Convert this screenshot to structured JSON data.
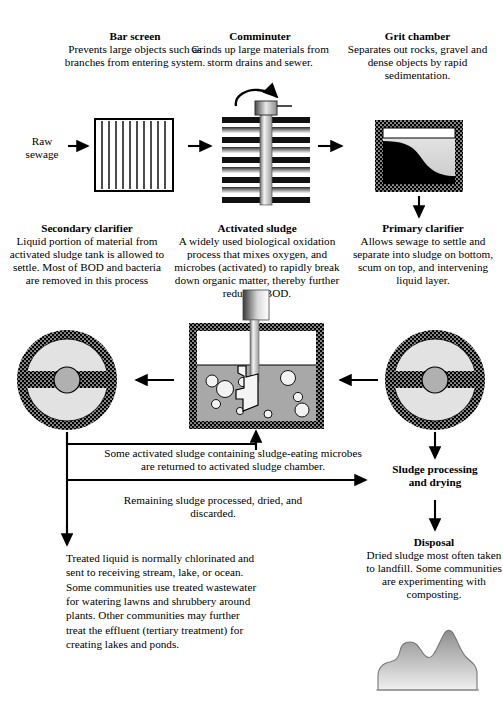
{
  "diagram": {
    "inlet_label": "Raw\nsewage",
    "inlet_label_line1": "Raw",
    "inlet_label_line2": "sewage"
  },
  "stages": {
    "bar_screen": {
      "heading": "Bar screen",
      "body": "Prevents large objects such as branches from entering system."
    },
    "comminuter": {
      "heading": "Comminuter",
      "body": "Grinds up large materials from storm drains and sewer."
    },
    "grit_chamber": {
      "heading": "Grit chamber",
      "body": "Separates out rocks, gravel and dense objects by rapid sedimentation."
    },
    "secondary_clarifier": {
      "heading": "Secondary clarifier",
      "body": "Liquid portion of material from activated sludge tank is allowed to settle. Most of BOD and bacteria are removed in this process"
    },
    "activated_sludge": {
      "heading": "Activated sludge",
      "body": "A widely used biological oxidation process that mixes oxygen, and microbes (activated) to rapidly break down organic matter, thereby further reducing BOD."
    },
    "primary_clarifier": {
      "heading": "Primary clarifier",
      "body": "Allows sewage to settle and separate into sludge on bottom, scum on top, and intervening liquid layer."
    },
    "sludge_processing": {
      "heading": "Sludge processing\nand drying",
      "heading_line1": "Sludge processing",
      "heading_line2": "and drying"
    },
    "disposal": {
      "heading": "Disposal",
      "body": "Dried sludge most often taken to landfill. Some communities are experimenting with composting."
    }
  },
  "notes": {
    "return_sludge": "Some activated sludge containing sludge-eating microbes are returned to activated sludge chamber.",
    "remaining_sludge": "Remaining sludge processed, dried, and discarded.",
    "treated_liquid": "Treated liquid is normally chlorinated and sent to receiving stream, lake, or ocean.  Some communities use treated wastewater for watering lawns and shrubbery around plants. Other communities may further treat the effluent (tertiary treatment) for creating lakes and ponds."
  },
  "colors": {
    "ink": "#000000",
    "tank_liquid": "#a8a8a8",
    "clarifier_fill": "#e2e2e2",
    "hub": "#b0b0b0",
    "bubble": "#f2f2f2",
    "mound_top": "#8e8e8e",
    "mound_bottom": "#f0f0f0"
  }
}
